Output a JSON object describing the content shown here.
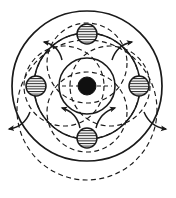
{
  "figure": {
    "description": "Vintage line engraving of an atom: a dark central nucleus surrounded by concentric solid orbit circles, four hatched electron particles on the middle orbit, overlapping dashed orbit circles offset through each particle, and radiating arrows indicating outward motion.",
    "style": "vintage engraving, black line art on white",
    "canvas": {
      "width": 176,
      "height": 198
    },
    "colors": {
      "ink": "#1a1a1a",
      "background": "#ffffff",
      "nucleus_fill": "#101010",
      "particle_fill": "#ffffff",
      "hatch": "#2a2a2a"
    }
  },
  "chart_data": {
    "type": "scatter",
    "xlabel": "",
    "ylabel": "",
    "grid": false,
    "legend": "none",
    "center": {
      "x": 87,
      "y": 86
    },
    "nucleus": {
      "cx": 87,
      "cy": 86,
      "r": 9,
      "fill": "solid-black",
      "label": "nucleus"
    },
    "solid_orbits": [
      {
        "name": "inner-orbit",
        "cx": 87,
        "cy": 86,
        "r": 28
      },
      {
        "name": "middle-orbit",
        "cx": 87,
        "cy": 86,
        "r": 53
      },
      {
        "name": "outer-orbit",
        "cx": 87,
        "cy": 86,
        "r": 75
      }
    ],
    "dashed_orbits": [
      {
        "name": "dashed-orbit-top",
        "cx": 87,
        "cy": 63,
        "r": 40
      },
      {
        "name": "dashed-orbit-bottom",
        "cx": 87,
        "cy": 112,
        "r": 40
      },
      {
        "name": "dashed-orbit-left",
        "cx": 64,
        "cy": 86,
        "r": 40
      },
      {
        "name": "dashed-orbit-right",
        "cx": 110,
        "cy": 86,
        "r": 40
      },
      {
        "name": "dashed-orbit-lower-large",
        "cx": 87,
        "cy": 110,
        "r": 70
      },
      {
        "name": "dashed-orbit-inner",
        "cx": 87,
        "cy": 86,
        "r": 53
      }
    ],
    "particles": [
      {
        "name": "electron-top",
        "cx": 87,
        "cy": 34,
        "r": 10,
        "fill": "hatched"
      },
      {
        "name": "electron-right",
        "cx": 139,
        "cy": 86,
        "r": 10,
        "fill": "hatched"
      },
      {
        "name": "electron-bottom",
        "cx": 87,
        "cy": 138,
        "r": 10,
        "fill": "hatched"
      },
      {
        "name": "electron-left",
        "cx": 36,
        "cy": 86,
        "r": 10,
        "fill": "hatched"
      }
    ],
    "arrows": [
      {
        "name": "arrow-outer-upper-left",
        "x1": 62,
        "y1": 60,
        "x2": 44,
        "y2": 42,
        "curve": 8
      },
      {
        "name": "arrow-outer-upper-right",
        "x1": 112,
        "y1": 60,
        "x2": 132,
        "y2": 42,
        "curve": -8
      },
      {
        "name": "arrow-outer-lower-left",
        "x1": 30,
        "y1": 112,
        "x2": 9,
        "y2": 129,
        "curve": -8
      },
      {
        "name": "arrow-outer-lower-right",
        "x1": 144,
        "y1": 112,
        "x2": 166,
        "y2": 129,
        "curve": 8
      },
      {
        "name": "arrow-inner-upper-left",
        "x1": 80,
        "y1": 128,
        "x2": 62,
        "y2": 108,
        "curve": 8
      },
      {
        "name": "arrow-inner-upper-right",
        "x1": 96,
        "y1": 128,
        "x2": 115,
        "y2": 108,
        "curve": -8
      }
    ],
    "axis_chord_lines": [
      {
        "name": "chord-horizontal",
        "x1": 62,
        "y1": 86,
        "x2": 112,
        "y2": 86
      }
    ]
  }
}
